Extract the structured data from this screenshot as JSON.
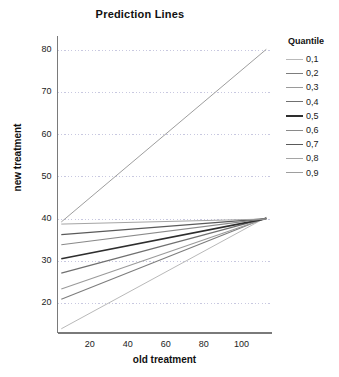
{
  "chart_data": {
    "type": "line",
    "title": "Prediction Lines",
    "xlabel": "old treatment",
    "ylabel": "new treatment",
    "xlim": [
      3,
      116
    ],
    "ylim": [
      13,
      83
    ],
    "grid": true,
    "grid_orientation": "horizontal",
    "xticks": [
      20,
      40,
      60,
      80,
      100
    ],
    "yticks": [
      20,
      30,
      40,
      50,
      60,
      70,
      80
    ],
    "legend_title": "Quantile",
    "legend_position": "right",
    "x": [
      5,
      113
    ],
    "series": [
      {
        "name": "0,1",
        "values": [
          14.0,
          40.4
        ],
        "color": "#b9b9b9",
        "width": 1.0
      },
      {
        "name": "0,2",
        "values": [
          21.0,
          40.3
        ],
        "color": "#7d7d7d",
        "width": 1.1
      },
      {
        "name": "0,3",
        "values": [
          23.4,
          40.2
        ],
        "color": "#9a9a9a",
        "width": 1.1
      },
      {
        "name": "0,4",
        "values": [
          27.2,
          40.2
        ],
        "color": "#707070",
        "width": 1.2
      },
      {
        "name": "0,5",
        "values": [
          30.6,
          40.1
        ],
        "color": "#2e2e2e",
        "width": 1.6
      },
      {
        "name": "0,6",
        "values": [
          33.9,
          40.1
        ],
        "color": "#8a8a8a",
        "width": 1.1
      },
      {
        "name": "0,7",
        "values": [
          36.3,
          40.1
        ],
        "color": "#5a5a5a",
        "width": 1.3
      },
      {
        "name": "0,8",
        "values": [
          38.8,
          40.0
        ],
        "color": "#a5a5a5",
        "width": 1.0
      },
      {
        "name": "0,9",
        "values": [
          39.3,
          80.2
        ],
        "color": "#9e9e9e",
        "width": 1.0
      }
    ],
    "axis_color": "#7a7a7a",
    "grid_color": "#c8c8e0",
    "background": "#ffffff"
  }
}
